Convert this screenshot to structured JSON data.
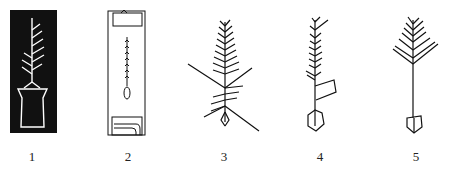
{
  "figure": {
    "panels": [
      {
        "label": "1",
        "motif": "rubbing-tree-in-pot",
        "style": "white-on-black rubbing"
      },
      {
        "label": "2",
        "motif": "narrow-panel-with-sprig",
        "style": "line drawing"
      },
      {
        "label": "3",
        "motif": "branching-tree-with-roots",
        "style": "line drawing"
      },
      {
        "label": "4",
        "motif": "tree-with-flag-and-hexagon-base",
        "style": "line drawing"
      },
      {
        "label": "5",
        "motif": "tree-with-pentagon-base",
        "style": "line drawing"
      }
    ],
    "colors": {
      "ink": "#111111",
      "background": "#ffffff",
      "label": "#222222"
    }
  }
}
